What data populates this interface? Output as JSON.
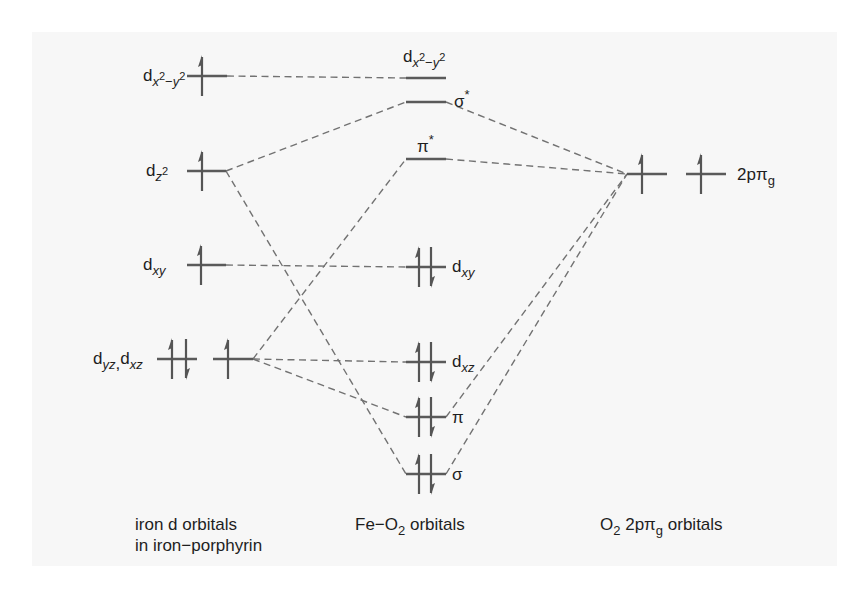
{
  "iron_column": {
    "caption": [
      "iron d orbitals",
      "in iron−porphyrin"
    ],
    "levels": [
      {
        "id": "dx2-y2",
        "label": {
          "base": "d",
          "sub": "x",
          "sup": "2",
          "op": "−",
          "sub2": "y",
          "sup2": "2"
        },
        "electrons": "↑"
      },
      {
        "id": "dz2",
        "label": {
          "base": "d",
          "sub": "z",
          "sup": "2"
        },
        "electrons": "↑"
      },
      {
        "id": "dxy",
        "label": {
          "base": "d",
          "sub": "xy"
        },
        "electrons": "↑"
      },
      {
        "id": "dyz,dxz",
        "label": {
          "base": "d",
          "sub": "yz",
          "sep": ",",
          "base2": "d",
          "sub2": "xz"
        },
        "electrons": [
          "↑↓",
          "↑"
        ]
      }
    ]
  },
  "feo2_column": {
    "caption": {
      "pre": "Fe−O",
      "sub": "2",
      "post": " orbitals"
    },
    "levels": [
      {
        "id": "dx2-y2",
        "label": {
          "base": "d",
          "sub": "x",
          "sup": "2",
          "op": "−",
          "sub2": "y",
          "sup2": "2"
        },
        "electrons": ""
      },
      {
        "id": "sigma*",
        "label": {
          "base": "σ",
          "sup": "*"
        },
        "electrons": ""
      },
      {
        "id": "pi*",
        "label": {
          "base": "π",
          "sup": "*"
        },
        "electrons": ""
      },
      {
        "id": "dxy",
        "label": {
          "base": "d",
          "sub": "xy"
        },
        "electrons": "↑↓"
      },
      {
        "id": "dxz",
        "label": {
          "base": "d",
          "sub": "xz"
        },
        "electrons": "↑↓"
      },
      {
        "id": "pi",
        "label": {
          "base": "π"
        },
        "electrons": "↑↓"
      },
      {
        "id": "sigma",
        "label": {
          "base": "σ"
        },
        "electrons": "↑↓"
      }
    ]
  },
  "o2_column": {
    "caption": {
      "pre": "O",
      "sub": "2",
      "mid": " 2pπ",
      "sub2": "g",
      "post": " orbitals"
    },
    "levels": [
      {
        "id": "2ppig",
        "label": {
          "base": "2pπ",
          "sub": "g"
        },
        "electrons": [
          "↑",
          "↑"
        ]
      }
    ]
  },
  "correlations": [
    {
      "from": "iron.dx2-y2",
      "to": "feo2.dx2-y2"
    },
    {
      "from": "iron.dz2",
      "to": "feo2.sigma*"
    },
    {
      "from": "feo2.sigma*",
      "to": "o2.2ppig"
    },
    {
      "from": "feo2.pi*",
      "to": "o2.2ppig"
    },
    {
      "from": "iron.dxz",
      "to": "feo2.pi*"
    },
    {
      "from": "iron.dxy",
      "to": "feo2.dxy"
    },
    {
      "from": "iron.dxz",
      "to": "feo2.dxz"
    },
    {
      "from": "iron.dxz",
      "to": "feo2.pi"
    },
    {
      "from": "iron.dz2",
      "to": "feo2.sigma"
    },
    {
      "from": "feo2.pi",
      "to": "o2.2ppig"
    },
    {
      "from": "feo2.sigma",
      "to": "o2.2ppig"
    }
  ],
  "colors": {
    "background": "#ffffff",
    "panel": "#f7f7f7",
    "level": "#5a5a5a",
    "dashed_line": "#727272",
    "text": "#1e1e1e"
  }
}
